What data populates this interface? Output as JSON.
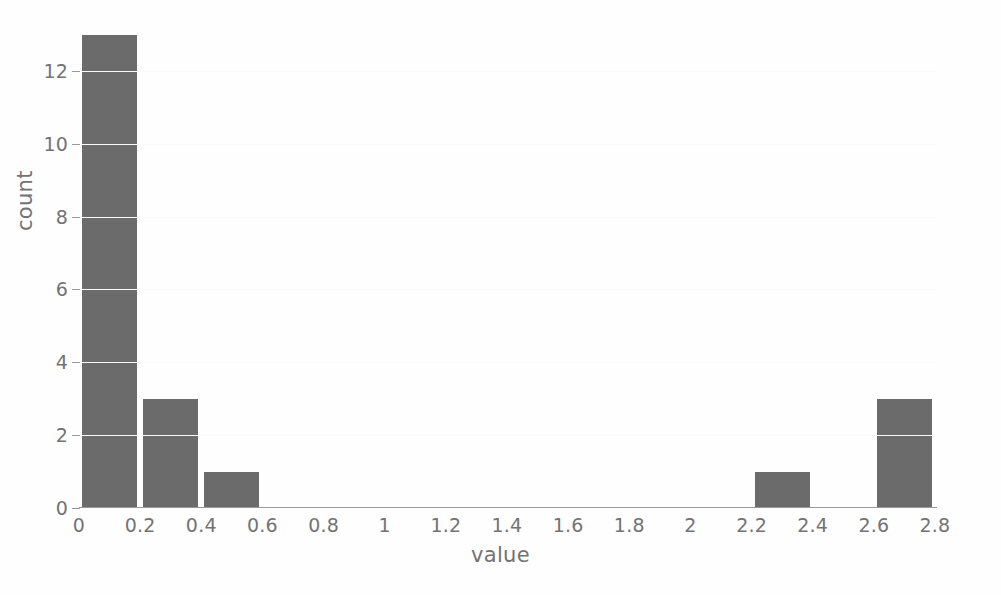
{
  "chart_data": {
    "type": "bar",
    "title": "",
    "xlabel": "value",
    "ylabel": "count",
    "bin_width": 0.2,
    "bin_starts": [
      0,
      0.2,
      0.4,
      0.6,
      0.8,
      1.0,
      1.2,
      1.4,
      1.6,
      1.8,
      2.0,
      2.2,
      2.4,
      2.6
    ],
    "categories": [
      "0-0.2",
      "0.2-0.4",
      "0.4-0.6",
      "0.6-0.8",
      "0.8-1",
      "1-1.2",
      "1.2-1.4",
      "1.4-1.6",
      "1.6-1.8",
      "1.8-2",
      "2-2.2",
      "2.2-2.4",
      "2.4-2.6",
      "2.6-2.8"
    ],
    "values": [
      13,
      3,
      1,
      0,
      0,
      0,
      0,
      0,
      0,
      0,
      0,
      1,
      0,
      3
    ],
    "xlim": [
      0,
      2.8
    ],
    "ylim": [
      0,
      13.4
    ],
    "x_ticks": [
      0,
      0.2,
      0.4,
      0.6,
      0.8,
      1,
      1.2,
      1.4,
      1.6,
      1.8,
      2,
      2.2,
      2.4,
      2.6,
      2.8
    ],
    "x_tick_labels": [
      "0",
      "0.2",
      "0.4",
      "0.6",
      "0.8",
      "1",
      "1.2",
      "1.4",
      "1.6",
      "1.8",
      "2",
      "2.2",
      "2.4",
      "2.6",
      "2.8"
    ],
    "y_ticks": [
      0,
      2,
      4,
      6,
      8,
      10,
      12
    ],
    "y_tick_labels": [
      "0",
      "2",
      "4",
      "6",
      "8",
      "10",
      "12"
    ],
    "grid": false,
    "legend": null,
    "bar_color": "#6b6b6b",
    "axis_color": "#9a9a9a",
    "text_color": "#737373",
    "background": "#ffffff"
  }
}
